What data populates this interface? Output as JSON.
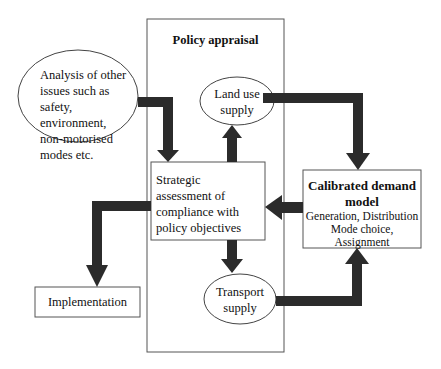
{
  "diagram": {
    "title": "Policy appraisal",
    "nodes": {
      "analysis": {
        "shape": "ellipse",
        "lines": [
          "Analysis of other",
          "issues such as",
          "safety, environment,",
          "non-motorised",
          "modes etc."
        ]
      },
      "land_use": {
        "shape": "ellipse",
        "lines": [
          "Land use",
          "supply"
        ]
      },
      "strategic": {
        "shape": "rectangle",
        "lines": [
          "Strategic",
          "assessment of",
          "compliance with",
          "policy objectives"
        ]
      },
      "calibrated": {
        "shape": "rectangle",
        "title_lines": [
          "Calibrated demand",
          "model"
        ],
        "lines": [
          "Generation, Distribution",
          "Mode choice,",
          "Assignment"
        ]
      },
      "transport": {
        "shape": "ellipse",
        "lines": [
          "Transport",
          "supply"
        ]
      },
      "implementation": {
        "shape": "rectangle",
        "lines": [
          "Implementation"
        ]
      }
    },
    "edges": [
      {
        "from": "analysis",
        "to": "strategic"
      },
      {
        "from": "strategic",
        "to": "land_use"
      },
      {
        "from": "land_use",
        "to": "calibrated"
      },
      {
        "from": "calibrated",
        "to": "strategic"
      },
      {
        "from": "strategic",
        "to": "transport"
      },
      {
        "from": "transport",
        "to": "calibrated"
      },
      {
        "from": "strategic",
        "to": "implementation"
      }
    ],
    "colors": {
      "arrow": "#2b2b2b",
      "outline": "#555555",
      "background": "#ffffff"
    }
  }
}
